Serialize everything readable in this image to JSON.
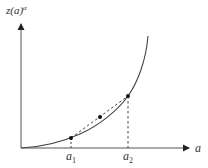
{
  "diagram": {
    "type": "convex-function-chord",
    "y_axis_label": "z(a)",
    "y_axis_label_sup": "α",
    "x_axis_label": "a",
    "points": [
      {
        "label": "a",
        "sub": "1"
      },
      {
        "label": "a",
        "sub": "2"
      }
    ],
    "colors": {
      "stroke": "#444444",
      "axis": "#555555",
      "dot": "#111111",
      "text": "#333333"
    }
  }
}
